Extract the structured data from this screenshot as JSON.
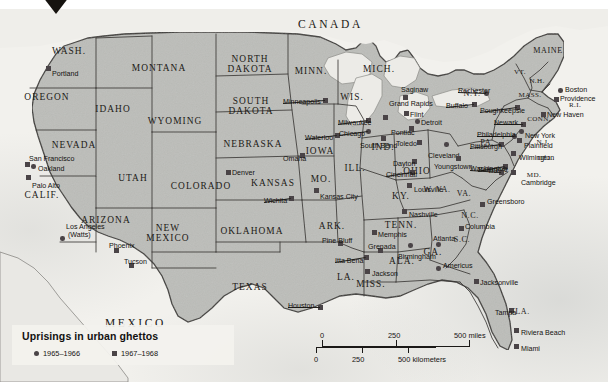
{
  "map": {
    "title_hidden": "",
    "countries": [
      {
        "name": "CANADA",
        "x": 298,
        "y": 19
      },
      {
        "name": "MEXICO",
        "x": 105,
        "y": 318
      }
    ],
    "states": [
      {
        "name": "WASH.",
        "x": 69,
        "y": 52,
        "size": "md"
      },
      {
        "name": "OREGON",
        "x": 47,
        "y": 98,
        "size": "md"
      },
      {
        "name": "IDAHO",
        "x": 113,
        "y": 110,
        "size": "md"
      },
      {
        "name": "MONTANA",
        "x": 159,
        "y": 69,
        "size": "md"
      },
      {
        "name": "WYOMING",
        "x": 175,
        "y": 122,
        "size": "md"
      },
      {
        "name": "NEVADA",
        "x": 74,
        "y": 146,
        "size": "md"
      },
      {
        "name": "UTAH",
        "x": 133,
        "y": 179,
        "size": "md"
      },
      {
        "name": "CALIF.",
        "x": 42,
        "y": 196,
        "size": "md"
      },
      {
        "name": "ARIZONA",
        "x": 106,
        "y": 221,
        "size": "md"
      },
      {
        "name": "NEW MEXICO",
        "x": 168,
        "y": 234,
        "size": "md"
      },
      {
        "name": "COLORADO",
        "x": 201,
        "y": 187,
        "size": "md"
      },
      {
        "name": "NORTH DAKOTA",
        "x": 250,
        "y": 65,
        "size": "md"
      },
      {
        "name": "SOUTH DAKOTA",
        "x": 251,
        "y": 107,
        "size": "md"
      },
      {
        "name": "NEBRASKA",
        "x": 253,
        "y": 145,
        "size": "md"
      },
      {
        "name": "KANSAS",
        "x": 273,
        "y": 184,
        "size": "md"
      },
      {
        "name": "OKLAHOMA",
        "x": 252,
        "y": 232,
        "size": "md"
      },
      {
        "name": "TEXAS",
        "x": 250,
        "y": 288,
        "size": "md"
      },
      {
        "name": "MINN.",
        "x": 311,
        "y": 72,
        "size": "md"
      },
      {
        "name": "IOWA",
        "x": 320,
        "y": 152,
        "size": "md"
      },
      {
        "name": "MO.",
        "x": 321,
        "y": 180,
        "size": "md"
      },
      {
        "name": "ARK.",
        "x": 332,
        "y": 227,
        "size": "md"
      },
      {
        "name": "LA.",
        "x": 346,
        "y": 278,
        "size": "md"
      },
      {
        "name": "MISS.",
        "x": 371,
        "y": 285,
        "size": "md"
      },
      {
        "name": "WIS.",
        "x": 352,
        "y": 98,
        "size": "md"
      },
      {
        "name": "ILL.",
        "x": 355,
        "y": 169,
        "size": "md"
      },
      {
        "name": "IND.",
        "x": 383,
        "y": 148,
        "size": "md"
      },
      {
        "name": "MICH.",
        "x": 379,
        "y": 70,
        "size": "md"
      },
      {
        "name": "OHIO",
        "x": 417,
        "y": 172,
        "size": "md"
      },
      {
        "name": "KY.",
        "x": 401,
        "y": 197,
        "size": "md"
      },
      {
        "name": "TENN.",
        "x": 401,
        "y": 226,
        "size": "md"
      },
      {
        "name": "ALA.",
        "x": 402,
        "y": 262,
        "size": "md"
      },
      {
        "name": "GA.",
        "x": 433,
        "y": 253,
        "size": "md"
      },
      {
        "name": "W. VA.",
        "x": 437,
        "y": 190,
        "size": "sm"
      },
      {
        "name": "VA.",
        "x": 464,
        "y": 194,
        "size": "sm"
      },
      {
        "name": "N.C.",
        "x": 470,
        "y": 216,
        "size": "sm"
      },
      {
        "name": "S.C.",
        "x": 462,
        "y": 240,
        "size": "sm"
      },
      {
        "name": "FLA.",
        "x": 520,
        "y": 312,
        "size": "sm"
      },
      {
        "name": "PA.",
        "x": 487,
        "y": 143,
        "size": "sm"
      },
      {
        "name": "N.Y.",
        "x": 472,
        "y": 94,
        "size": "sm"
      },
      {
        "name": "MAINE",
        "x": 548,
        "y": 51,
        "size": "sm"
      },
      {
        "name": "VT.",
        "x": 520,
        "y": 73,
        "size": "xs"
      },
      {
        "name": "N.H.",
        "x": 537,
        "y": 82,
        "size": "xs"
      },
      {
        "name": "MASS.",
        "x": 530,
        "y": 96,
        "size": "xs"
      },
      {
        "name": "R.I.",
        "x": 575,
        "y": 106,
        "size": "xs"
      },
      {
        "name": "CONN.",
        "x": 539,
        "y": 120,
        "size": "xs"
      },
      {
        "name": "N.J.",
        "x": 543,
        "y": 143,
        "size": "xs"
      },
      {
        "name": "DEL.",
        "x": 546,
        "y": 159,
        "size": "xs"
      },
      {
        "name": "MD.",
        "x": 534,
        "y": 176,
        "size": "xs"
      },
      {
        "name": "D.C.",
        "x": 496,
        "y": 172,
        "size": "xs"
      }
    ],
    "cities": [
      {
        "name": "Portland",
        "x": 52,
        "y": 71,
        "mx": 48,
        "my": 68,
        "anchor": "left",
        "type": "u67"
      },
      {
        "name": "San Francisco",
        "x": 29,
        "y": 156,
        "mx": 27,
        "my": 164,
        "anchor": "left",
        "type": "u67"
      },
      {
        "name": "Oakland",
        "x": 38,
        "y": 166,
        "mx": 33,
        "my": 166,
        "anchor": "left",
        "type": "u65"
      },
      {
        "name": "Palo Alto",
        "x": 32,
        "y": 183,
        "mx": 28,
        "my": 177,
        "anchor": "left",
        "type": "u67"
      },
      {
        "name": "Los Angeles",
        "x": 66,
        "y": 224,
        "mx": 62,
        "my": 238,
        "anchor": "left",
        "type": "u65"
      },
      {
        "name": "(Watts)",
        "x": 68,
        "y": 232,
        "mx": -1,
        "my": -1,
        "anchor": "left",
        "type": "none"
      },
      {
        "name": "Phoenix",
        "x": 109,
        "y": 243,
        "mx": 116,
        "my": 250,
        "anchor": "left",
        "type": "u67"
      },
      {
        "name": "Tucson",
        "x": 124,
        "y": 259,
        "mx": 131,
        "my": 265,
        "anchor": "left",
        "type": "u67"
      },
      {
        "name": "Denver",
        "x": 232,
        "y": 170,
        "mx": 228,
        "my": 172,
        "anchor": "left",
        "type": "u67"
      },
      {
        "name": "Wichita",
        "x": 264,
        "y": 198,
        "mx": 291,
        "my": 198,
        "anchor": "left",
        "type": "u67"
      },
      {
        "name": "Omaha",
        "x": 283,
        "y": 156,
        "mx": 302,
        "my": 155,
        "anchor": "left",
        "type": "u67"
      },
      {
        "name": "Minneapolis",
        "x": 283,
        "y": 99,
        "mx": 325,
        "my": 100,
        "anchor": "left",
        "type": "u67"
      },
      {
        "name": "Waterloo",
        "x": 305,
        "y": 135,
        "mx": 337,
        "my": 135,
        "anchor": "left",
        "type": "u67"
      },
      {
        "name": "Milwaukee",
        "x": 338,
        "y": 120,
        "mx": 368,
        "my": 120,
        "anchor": "left",
        "type": "u67"
      },
      {
        "name": "Chicago",
        "x": 339,
        "y": 131,
        "mx": 368,
        "my": 131,
        "anchor": "left",
        "type": "u65"
      },
      {
        "name": "Kansas City",
        "x": 320,
        "y": 194,
        "mx": 316,
        "my": 190,
        "anchor": "left",
        "type": "u67"
      },
      {
        "name": "South Bend",
        "x": 360,
        "y": 143,
        "mx": 383,
        "my": 138,
        "anchor": "left",
        "type": "u67"
      },
      {
        "name": "Grand Rapids",
        "x": 389,
        "y": 101,
        "mx": 385,
        "my": 117,
        "anchor": "left",
        "type": "u67"
      },
      {
        "name": "Saginaw",
        "x": 401,
        "y": 87,
        "mx": 405,
        "my": 97,
        "anchor": "left",
        "type": "u67"
      },
      {
        "name": "Flint",
        "x": 410,
        "y": 112,
        "mx": 406,
        "my": 113,
        "anchor": "left",
        "type": "u67"
      },
      {
        "name": "Pontiac",
        "x": 391,
        "y": 130,
        "mx": 411,
        "my": 128,
        "anchor": "left",
        "type": "u67"
      },
      {
        "name": "Detroit",
        "x": 421,
        "y": 120,
        "mx": 417,
        "my": 121,
        "anchor": "left",
        "type": "u65"
      },
      {
        "name": "Toledo",
        "x": 396,
        "y": 141,
        "mx": 419,
        "my": 142,
        "anchor": "left",
        "type": "u67"
      },
      {
        "name": "Dayton",
        "x": 393,
        "y": 161,
        "mx": 414,
        "my": 161,
        "anchor": "left",
        "type": "u67"
      },
      {
        "name": "Cincinnati",
        "x": 386,
        "y": 172,
        "mx": 412,
        "my": 172,
        "anchor": "left",
        "type": "u67"
      },
      {
        "name": "Cleveland",
        "x": 428,
        "y": 153,
        "mx": 446,
        "my": 144,
        "anchor": "left",
        "type": "u65"
      },
      {
        "name": "Youngstown",
        "x": 434,
        "y": 164,
        "mx": 458,
        "my": 158,
        "anchor": "left",
        "type": "u67"
      },
      {
        "name": "Rochester",
        "x": 458,
        "y": 88,
        "mx": 486,
        "my": 93,
        "anchor": "left",
        "type": "u65"
      },
      {
        "name": "Buffalo",
        "x": 446,
        "y": 103,
        "mx": 474,
        "my": 104,
        "anchor": "left",
        "type": "u67"
      },
      {
        "name": "Poughkeepsie",
        "x": 480,
        "y": 108,
        "mx": 517,
        "my": 107,
        "anchor": "left",
        "type": "u67"
      },
      {
        "name": "Boston",
        "x": 565,
        "y": 87,
        "mx": 560,
        "my": 90,
        "anchor": "left",
        "type": "u65"
      },
      {
        "name": "Providence",
        "x": 560,
        "y": 96,
        "mx": 556,
        "my": 99,
        "anchor": "left",
        "type": "u67"
      },
      {
        "name": "New Haven",
        "x": 547,
        "y": 112,
        "mx": 543,
        "my": 114,
        "anchor": "left",
        "type": "u67"
      },
      {
        "name": "Newark",
        "x": 494,
        "y": 120,
        "mx": 523,
        "my": 124,
        "anchor": "left",
        "type": "u67"
      },
      {
        "name": "New York",
        "x": 525,
        "y": 133,
        "mx": 521,
        "my": 131,
        "anchor": "left",
        "type": "u65"
      },
      {
        "name": "Plainfield",
        "x": 524,
        "y": 143,
        "mx": 519,
        "my": 140,
        "anchor": "left",
        "type": "u67"
      },
      {
        "name": "Philadelphia",
        "x": 477,
        "y": 132,
        "mx": 514,
        "my": 136,
        "anchor": "left",
        "type": "u65"
      },
      {
        "name": "Pittsburgh",
        "x": 470,
        "y": 144,
        "mx": 501,
        "my": 144,
        "anchor": "left",
        "type": "u67"
      },
      {
        "name": "Baltimore",
        "x": 478,
        "y": 167,
        "mx": 505,
        "my": 166,
        "anchor": "left",
        "type": "u67"
      },
      {
        "name": "Wilmington",
        "x": 519,
        "y": 155,
        "mx": 513,
        "my": 153,
        "anchor": "left",
        "type": "u67"
      },
      {
        "name": "Washington",
        "x": 470,
        "y": 166,
        "mx": 501,
        "my": 172,
        "anchor": "left",
        "type": "u67"
      },
      {
        "name": "Cambridge",
        "x": 521,
        "y": 180,
        "mx": 513,
        "my": 172,
        "anchor": "left",
        "type": "u67"
      },
      {
        "name": "Louisville",
        "x": 414,
        "y": 187,
        "mx": 409,
        "my": 185,
        "anchor": "left",
        "type": "u67"
      },
      {
        "name": "Nashville",
        "x": 409,
        "y": 212,
        "mx": 404,
        "my": 211,
        "anchor": "left",
        "type": "u67"
      },
      {
        "name": "Greensboro",
        "x": 487,
        "y": 199,
        "mx": 482,
        "my": 204,
        "anchor": "left",
        "type": "u67"
      },
      {
        "name": "Columbia",
        "x": 465,
        "y": 224,
        "mx": 461,
        "my": 228,
        "anchor": "left",
        "type": "u67"
      },
      {
        "name": "Memphis",
        "x": 378,
        "y": 232,
        "mx": 374,
        "my": 232,
        "anchor": "left",
        "type": "u67"
      },
      {
        "name": "Atlanta",
        "x": 433,
        "y": 236,
        "mx": 438,
        "my": 244,
        "anchor": "left",
        "type": "u65"
      },
      {
        "name": "Americus",
        "x": 443,
        "y": 263,
        "mx": 438,
        "my": 268,
        "anchor": "left",
        "type": "u65"
      },
      {
        "name": "Birmingham",
        "x": 398,
        "y": 254,
        "mx": 410,
        "my": 245,
        "anchor": "left",
        "type": "u65"
      },
      {
        "name": "Grenada",
        "x": 368,
        "y": 244,
        "mx": 380,
        "my": 250,
        "anchor": "left",
        "type": "u67"
      },
      {
        "name": "Pine Bluff",
        "x": 322,
        "y": 238,
        "mx": 340,
        "my": 243,
        "anchor": "left",
        "type": "u67"
      },
      {
        "name": "Itta Bena",
        "x": 335,
        "y": 258,
        "mx": 366,
        "my": 257,
        "anchor": "left",
        "type": "u67"
      },
      {
        "name": "Jackson",
        "x": 372,
        "y": 271,
        "mx": 367,
        "my": 271,
        "anchor": "left",
        "type": "u67"
      },
      {
        "name": "Jacksonville",
        "x": 480,
        "y": 280,
        "mx": 476,
        "my": 281,
        "anchor": "left",
        "type": "u67"
      },
      {
        "name": "Tampa",
        "x": 495,
        "y": 310,
        "mx": 511,
        "my": 310,
        "anchor": "left",
        "type": "u67"
      },
      {
        "name": "Riviera Beach",
        "x": 521,
        "y": 330,
        "mx": 516,
        "my": 330,
        "anchor": "left",
        "type": "u67"
      },
      {
        "name": "Miami",
        "x": 521,
        "y": 346,
        "mx": 516,
        "my": 346,
        "anchor": "left",
        "type": "u67"
      },
      {
        "name": "Houston",
        "x": 288,
        "y": 303,
        "mx": 320,
        "my": 307,
        "anchor": "left",
        "type": "u67"
      }
    ],
    "legend": {
      "title": "Uprisings in urban ghettos",
      "entries": [
        {
          "label": "1965–1966",
          "shape": "circle",
          "color": "#4a4447"
        },
        {
          "label": "1967–1968",
          "shape": "square",
          "color": "#4a4447"
        }
      ]
    },
    "scale": {
      "miles": {
        "ticks": [
          "0",
          "250",
          "500 miles"
        ],
        "unit": "miles"
      },
      "kilometers": {
        "ticks": [
          "0",
          "250",
          "500 kilometers"
        ],
        "unit": "kilometers"
      }
    },
    "colors": {
      "land": "#bcbdb9",
      "ocean": "#f2f1ed",
      "border": "#3b3936",
      "marker": "#4a4447",
      "text": "#15130f"
    }
  }
}
